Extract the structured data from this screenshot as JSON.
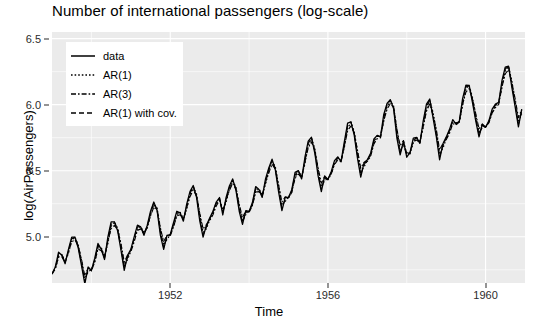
{
  "chart_data": {
    "type": "line",
    "title": "Number of international passengers (log-scale)",
    "xlabel": "Time",
    "ylabel": "log(AirPassengers)",
    "xlim": [
      1949.0,
      1961.0
    ],
    "ylim": [
      4.65,
      6.55
    ],
    "xticks": [
      1952,
      1956,
      1960
    ],
    "xtick_labels": [
      "1952",
      "1956",
      "1960"
    ],
    "yticks": [
      5.0,
      5.5,
      6.0,
      6.5
    ],
    "ytick_labels": [
      "5.0",
      "5.5",
      "6.0",
      "6.5"
    ],
    "grid": true,
    "legend_position": "top-left",
    "panel_background": "#ebebeb",
    "grid_color": "#ffffff",
    "line_color": "#000000",
    "series": [
      {
        "name": "data",
        "style": "solid",
        "x": [
          1949.0,
          1949.083,
          1949.167,
          1949.25,
          1949.333,
          1949.417,
          1949.5,
          1949.583,
          1949.667,
          1949.75,
          1949.833,
          1949.917,
          1950.0,
          1950.083,
          1950.167,
          1950.25,
          1950.333,
          1950.417,
          1950.5,
          1950.583,
          1950.667,
          1950.75,
          1950.833,
          1950.917,
          1951.0,
          1951.083,
          1951.167,
          1951.25,
          1951.333,
          1951.417,
          1951.5,
          1951.583,
          1951.667,
          1951.75,
          1951.833,
          1951.917,
          1952.0,
          1952.083,
          1952.167,
          1952.25,
          1952.333,
          1952.417,
          1952.5,
          1952.583,
          1952.667,
          1952.75,
          1952.833,
          1952.917,
          1953.0,
          1953.083,
          1953.167,
          1953.25,
          1953.333,
          1953.417,
          1953.5,
          1953.583,
          1953.667,
          1953.75,
          1953.833,
          1953.917,
          1954.0,
          1954.083,
          1954.167,
          1954.25,
          1954.333,
          1954.417,
          1954.5,
          1954.583,
          1954.667,
          1954.75,
          1954.833,
          1954.917,
          1955.0,
          1955.083,
          1955.167,
          1955.25,
          1955.333,
          1955.417,
          1955.5,
          1955.583,
          1955.667,
          1955.75,
          1955.833,
          1955.917,
          1956.0,
          1956.083,
          1956.167,
          1956.25,
          1956.333,
          1956.417,
          1956.5,
          1956.583,
          1956.667,
          1956.75,
          1956.833,
          1956.917,
          1957.0,
          1957.083,
          1957.167,
          1957.25,
          1957.333,
          1957.417,
          1957.5,
          1957.583,
          1957.667,
          1957.75,
          1957.833,
          1957.917,
          1958.0,
          1958.083,
          1958.167,
          1958.25,
          1958.333,
          1958.417,
          1958.5,
          1958.583,
          1958.667,
          1958.75,
          1958.833,
          1958.917,
          1959.0,
          1959.083,
          1959.167,
          1959.25,
          1959.333,
          1959.417,
          1959.5,
          1959.583,
          1959.667,
          1959.75,
          1959.833,
          1959.917,
          1960.0,
          1960.083,
          1960.167,
          1960.25,
          1960.333,
          1960.417,
          1960.5,
          1960.583,
          1960.667,
          1960.75,
          1960.833,
          1960.917
        ],
        "y": [
          4.718,
          4.771,
          4.883,
          4.86,
          4.796,
          4.905,
          4.997,
          4.997,
          4.913,
          4.779,
          4.644,
          4.771,
          4.745,
          4.836,
          4.949,
          4.905,
          4.828,
          4.997,
          5.112,
          5.112,
          5.043,
          4.898,
          4.745,
          4.86,
          4.905,
          4.997,
          5.088,
          5.075,
          5.011,
          5.087,
          5.193,
          5.263,
          5.198,
          5.011,
          4.905,
          5.011,
          5.017,
          5.106,
          5.193,
          5.182,
          5.118,
          5.247,
          5.342,
          5.388,
          5.298,
          5.118,
          4.997,
          5.087,
          5.142,
          5.193,
          5.263,
          5.297,
          5.165,
          5.298,
          5.384,
          5.438,
          5.351,
          5.193,
          5.094,
          5.198,
          5.192,
          5.257,
          5.38,
          5.357,
          5.298,
          5.438,
          5.521,
          5.587,
          5.505,
          5.338,
          5.198,
          5.298,
          5.298,
          5.356,
          5.487,
          5.501,
          5.438,
          5.602,
          5.724,
          5.753,
          5.634,
          5.463,
          5.342,
          5.46,
          5.434,
          5.493,
          5.576,
          5.605,
          5.568,
          5.72,
          5.86,
          5.87,
          5.769,
          5.595,
          5.451,
          5.561,
          5.583,
          5.631,
          5.74,
          5.768,
          5.756,
          5.926,
          6.009,
          6.038,
          5.969,
          5.746,
          5.62,
          5.724,
          5.602,
          5.638,
          5.746,
          5.752,
          5.707,
          5.875,
          6.005,
          6.043,
          5.9,
          5.757,
          5.583,
          5.704,
          5.754,
          5.811,
          5.887,
          5.852,
          5.874,
          6.046,
          6.147,
          6.145,
          6.017,
          5.878,
          5.757,
          5.852,
          5.829,
          5.877,
          5.966,
          6.004,
          6.017,
          6.184,
          6.285,
          6.292,
          6.131,
          5.983,
          5.832,
          5.966
        ]
      },
      {
        "name": "AR(1)",
        "style": "dotted",
        "note": "one-step-ahead AR(1) fitted values tracking the data with slight lag"
      },
      {
        "name": "AR(3)",
        "style": "dashdot",
        "note": "one-step-ahead AR(3) fitted values tracking the data with slight lag"
      },
      {
        "name": "AR(1) with cov.",
        "style": "dashed",
        "note": "AR(1) with covariates fitted values, closest to the data"
      }
    ]
  },
  "legend": {
    "items": [
      {
        "label": "data",
        "style": "solid"
      },
      {
        "label": "AR(1)",
        "style": "dotted"
      },
      {
        "label": "AR(3)",
        "style": "dashdot"
      },
      {
        "label": "AR(1) with cov.",
        "style": "dashed"
      }
    ]
  }
}
